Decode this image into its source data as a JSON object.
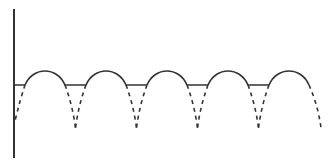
{
  "diagram": {
    "type": "waveform",
    "colors": {
      "line": "#333333",
      "background": "#ffffff"
    },
    "axis": {
      "x": 14,
      "y_top": 9,
      "y_bottom": 158
    },
    "baseline_y": 85,
    "peak_y": 71,
    "trough_y": 128,
    "arches": [
      {
        "start": 25,
        "end": 65
      },
      {
        "start": 86,
        "end": 126
      },
      {
        "start": 147,
        "end": 187
      },
      {
        "start": 208,
        "end": 248
      },
      {
        "start": 269,
        "end": 309
      }
    ]
  }
}
